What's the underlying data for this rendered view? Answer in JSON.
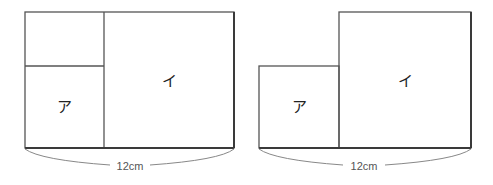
{
  "figures": [
    {
      "id": "left",
      "regions": [
        {
          "name": "upper-left",
          "label": ""
        },
        {
          "name": "a",
          "label": "ア"
        },
        {
          "name": "i",
          "label": "イ"
        }
      ],
      "dimension": "12cm"
    },
    {
      "id": "right",
      "regions": [
        {
          "name": "a",
          "label": "ア"
        },
        {
          "name": "i",
          "label": "イ"
        }
      ],
      "dimension": "12cm"
    }
  ],
  "colors": {
    "line": "#555555",
    "text": "#222222",
    "background": "#ffffff"
  }
}
